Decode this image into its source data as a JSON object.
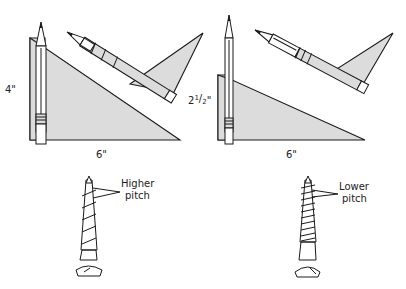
{
  "panels": [
    {
      "id": "left",
      "height_label": "4\"",
      "base_label": "6\"",
      "screw_label_line1": "Higher",
      "screw_label_line2": "pitch"
    },
    {
      "id": "right",
      "height_label_main": "2",
      "height_label_num": "1",
      "height_label_sep": "/",
      "height_label_den": "2",
      "height_label_quote": "\"",
      "base_label": "6\"",
      "screw_label_line1": "Lower",
      "screw_label_line2": "pitch"
    }
  ],
  "colors": {
    "triangle_fill": "#dcdcdc",
    "ink": "#1a1a1a",
    "background": "#ffffff"
  }
}
